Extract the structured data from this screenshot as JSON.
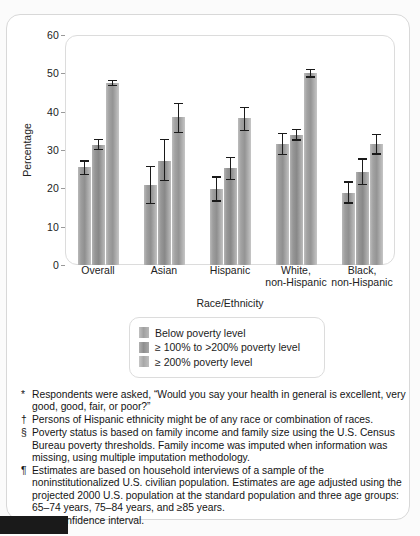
{
  "chart_data": {
    "type": "bar",
    "title": "",
    "xlabel": "Race/Ethnicity",
    "ylabel": "Percentage",
    "ylim": [
      0,
      60
    ],
    "yticks": [
      0,
      10,
      20,
      30,
      40,
      50,
      60
    ],
    "grid": false,
    "legend_position": "below-plot",
    "error_bars": "95% confidence interval",
    "categories": [
      "Overall",
      "Asian",
      "Hispanic",
      "White,\nnon-Hispanic",
      "Black,\nnon-Hispanic"
    ],
    "series": [
      {
        "name": "Below poverty level",
        "values": [
          25.5,
          20.8,
          19.8,
          31.5,
          18.9
        ],
        "ci_low": [
          23.4,
          15.8,
          16.5,
          28.6,
          15.9
        ],
        "ci_high": [
          27.4,
          25.9,
          23.1,
          34.5,
          21.9
        ]
      },
      {
        "name": "≥ 100% to >200% poverty level",
        "values": [
          31.4,
          27.2,
          25.2,
          34.0,
          24.3
        ],
        "ci_low": [
          29.9,
          21.8,
          22.1,
          32.4,
          20.8
        ],
        "ci_high": [
          32.9,
          33.0,
          28.3,
          35.6,
          27.8
        ]
      },
      {
        "name": "≥ 200% poverty level",
        "values": [
          47.5,
          38.6,
          38.3,
          50.0,
          31.6
        ],
        "ci_low": [
          46.6,
          34.4,
          34.9,
          48.9,
          28.8
        ],
        "ci_high": [
          48.3,
          42.3,
          41.3,
          51.2,
          34.3
        ]
      }
    ]
  },
  "chart": {
    "y_axis_title": "Percentage",
    "x_axis_title": "Race/Ethnicity",
    "y_ticks": [
      "60",
      "50",
      "40",
      "30",
      "20",
      "10",
      "0"
    ],
    "x_labels": [
      "Overall",
      "Asian",
      "Hispanic",
      "White,|non-Hispanic",
      "Black,|non-Hispanic"
    ]
  },
  "legend": {
    "items": [
      "Below poverty level",
      "≥ 100% to >200% poverty level",
      "≥ 200% poverty level"
    ]
  },
  "footnotes": [
    {
      "mark": "*",
      "text": "Respondents were asked, “Would you say your health in general is excellent, very good, good, fair, or poor?”"
    },
    {
      "mark": "†",
      "text": "Persons of Hispanic ethnicity might be of any race or combination of races."
    },
    {
      "mark": "§",
      "text": "Poverty status is based on family income and family size using the U.S. Census Bureau poverty thresholds. Family income was imputed when information was missing, using multiple imputation methodology."
    },
    {
      "mark": "¶",
      "text": "Estimates are based on household interviews of a sample of the noninstitutionalized U.S. civilian population. Estimates are age adjusted using the projected 2000 U.S. population at the standard population and three age groups: 65–74 years, 75–84 years, and ≥85 years."
    },
    {
      "mark": "**",
      "text": "95% confidence interval."
    }
  ]
}
